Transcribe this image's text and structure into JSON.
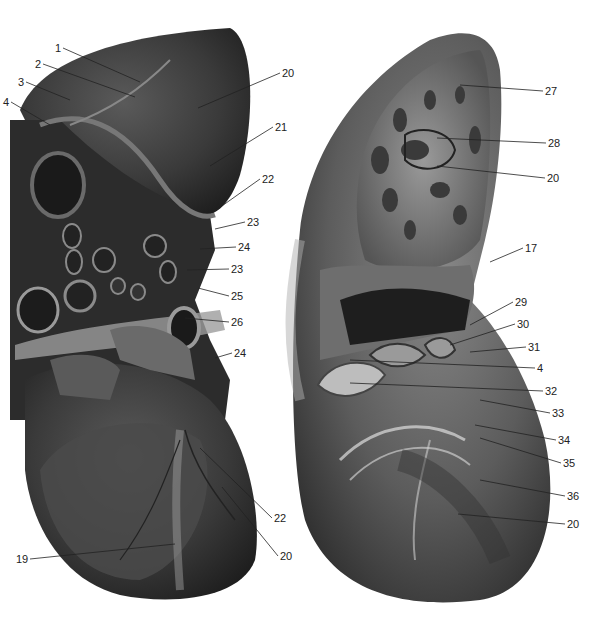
{
  "figure": {
    "views": [
      {
        "name": "external-view",
        "labels": [
          {
            "text": "1",
            "x": 55,
            "y": 42,
            "tx": 140,
            "ty": 82
          },
          {
            "text": "2",
            "x": 35,
            "y": 58,
            "tx": 135,
            "ty": 97
          },
          {
            "text": "3",
            "x": 18,
            "y": 76,
            "tx": 70,
            "ty": 100
          },
          {
            "text": "4",
            "x": 3,
            "y": 96,
            "tx": 50,
            "ty": 125
          },
          {
            "text": "20",
            "x": 282,
            "y": 67,
            "tx": 198,
            "ty": 108
          },
          {
            "text": "21",
            "x": 275,
            "y": 121,
            "tx": 210,
            "ty": 166
          },
          {
            "text": "22",
            "x": 262,
            "y": 173,
            "tx": 212,
            "ty": 213
          },
          {
            "text": "23",
            "x": 247,
            "y": 216,
            "tx": 215,
            "ty": 229
          },
          {
            "text": "24",
            "x": 238,
            "y": 241,
            "tx": 200,
            "ty": 249
          },
          {
            "text": "23",
            "x": 231,
            "y": 263,
            "tx": 187,
            "ty": 270
          },
          {
            "text": "25",
            "x": 231,
            "y": 290,
            "tx": 198,
            "ty": 288
          },
          {
            "text": "26",
            "x": 231,
            "y": 316,
            "tx": 185,
            "ty": 318
          },
          {
            "text": "24",
            "x": 234,
            "y": 347,
            "tx": 215,
            "ty": 358
          },
          {
            "text": "22",
            "x": 274,
            "y": 512,
            "tx": 200,
            "ty": 448
          },
          {
            "text": "20",
            "x": 280,
            "y": 550,
            "tx": 222,
            "ty": 487
          },
          {
            "text": "19",
            "x": 16,
            "y": 553,
            "tx": 175,
            "ty": 544
          }
        ]
      },
      {
        "name": "interior-view",
        "labels": [
          {
            "text": "27",
            "x": 545,
            "y": 85,
            "tx": 460,
            "ty": 85
          },
          {
            "text": "28",
            "x": 548,
            "y": 137,
            "tx": 437,
            "ty": 138
          },
          {
            "text": "20",
            "x": 547,
            "y": 172,
            "tx": 437,
            "ty": 166
          },
          {
            "text": "17",
            "x": 525,
            "y": 242,
            "tx": 490,
            "ty": 262
          },
          {
            "text": "29",
            "x": 515,
            "y": 296,
            "tx": 470,
            "ty": 325
          },
          {
            "text": "30",
            "x": 517,
            "y": 318,
            "tx": 450,
            "ty": 345
          },
          {
            "text": "31",
            "x": 528,
            "y": 341,
            "tx": 470,
            "ty": 352
          },
          {
            "text": "4",
            "x": 537,
            "y": 362,
            "tx": 350,
            "ty": 360
          },
          {
            "text": "32",
            "x": 545,
            "y": 385,
            "tx": 350,
            "ty": 383
          },
          {
            "text": "33",
            "x": 552,
            "y": 407,
            "tx": 480,
            "ty": 400
          },
          {
            "text": "34",
            "x": 558,
            "y": 434,
            "tx": 475,
            "ty": 425
          },
          {
            "text": "35",
            "x": 563,
            "y": 457,
            "tx": 480,
            "ty": 438
          },
          {
            "text": "36",
            "x": 567,
            "y": 490,
            "tx": 480,
            "ty": 480
          },
          {
            "text": "20",
            "x": 567,
            "y": 518,
            "tx": 458,
            "ty": 514
          }
        ]
      }
    ],
    "palette": {
      "background": "#ffffff",
      "tissue_dark": "#2a2a2a",
      "tissue_mid": "#555555",
      "tissue_light": "#8a8a8a",
      "label": "#222222"
    }
  }
}
